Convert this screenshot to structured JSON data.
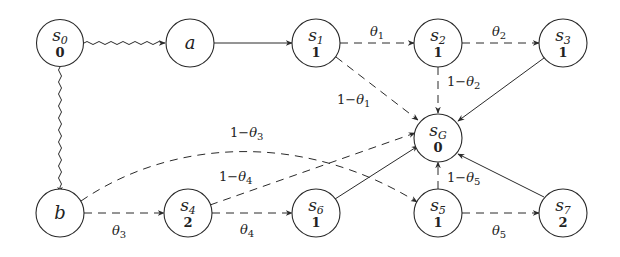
{
  "diagram": {
    "type": "state-graph",
    "nodes": [
      {
        "id": "s0",
        "name": "s",
        "sub": "0",
        "value": "0",
        "x": 60,
        "y": 43
      },
      {
        "id": "a",
        "name": "a",
        "sub": "",
        "value": "",
        "x": 190,
        "y": 43
      },
      {
        "id": "s1",
        "name": "s",
        "sub": "1",
        "value": "1",
        "x": 316,
        "y": 43
      },
      {
        "id": "s2",
        "name": "s",
        "sub": "2",
        "value": "1",
        "x": 438,
        "y": 43
      },
      {
        "id": "s3",
        "name": "s",
        "sub": "3",
        "value": "1",
        "x": 563,
        "y": 43
      },
      {
        "id": "sG",
        "name": "s",
        "sub": "G",
        "value": "0",
        "x": 438,
        "y": 138
      },
      {
        "id": "b",
        "name": "b",
        "sub": "",
        "value": "",
        "x": 60,
        "y": 213
      },
      {
        "id": "s4",
        "name": "s",
        "sub": "4",
        "value": "2",
        "x": 188,
        "y": 213
      },
      {
        "id": "s6",
        "name": "s",
        "sub": "6",
        "value": "1",
        "x": 316,
        "y": 213
      },
      {
        "id": "s5",
        "name": "s",
        "sub": "5",
        "value": "1",
        "x": 438,
        "y": 213
      },
      {
        "id": "s7",
        "name": "s",
        "sub": "7",
        "value": "2",
        "x": 563,
        "y": 213
      }
    ],
    "edges": [
      {
        "from": "s0",
        "to": "a",
        "style": "wavy",
        "label": ""
      },
      {
        "from": "s0",
        "to": "b",
        "style": "wavy",
        "label": ""
      },
      {
        "from": "a",
        "to": "s1",
        "style": "solid",
        "label": ""
      },
      {
        "from": "s1",
        "to": "s2",
        "style": "dashed",
        "label": "θ",
        "label_sub": "1"
      },
      {
        "from": "s2",
        "to": "s3",
        "style": "dashed",
        "label": "θ",
        "label_sub": "2"
      },
      {
        "from": "s1",
        "to": "sG",
        "style": "dashed",
        "label": "1−θ",
        "label_sub": "1"
      },
      {
        "from": "s2",
        "to": "sG",
        "style": "dashed",
        "label": "1−θ",
        "label_sub": "2"
      },
      {
        "from": "s3",
        "to": "sG",
        "style": "solid",
        "label": ""
      },
      {
        "from": "b",
        "to": "s4",
        "style": "dashed",
        "label": "θ",
        "label_sub": "3"
      },
      {
        "from": "b",
        "to": "s5",
        "style": "dashed-curved",
        "label": "1−θ",
        "label_sub": "3"
      },
      {
        "from": "s4",
        "to": "s6",
        "style": "dashed",
        "label": "θ",
        "label_sub": "4"
      },
      {
        "from": "s4",
        "to": "sG",
        "style": "dashed",
        "label": "1−θ",
        "label_sub": "4"
      },
      {
        "from": "s6",
        "to": "sG",
        "style": "solid",
        "label": ""
      },
      {
        "from": "s5",
        "to": "sG",
        "style": "dashed",
        "label": "1−θ",
        "label_sub": "5"
      },
      {
        "from": "s5",
        "to": "s7",
        "style": "dashed",
        "label": "θ",
        "label_sub": "5"
      },
      {
        "from": "s7",
        "to": "sG",
        "style": "solid",
        "label": ""
      }
    ]
  },
  "labels": {
    "s0": {
      "main": "s",
      "sub": "0",
      "val": "0"
    },
    "a": {
      "main": "a"
    },
    "s1": {
      "main": "s",
      "sub": "1",
      "val": "1"
    },
    "s2": {
      "main": "s",
      "sub": "2",
      "val": "1"
    },
    "s3": {
      "main": "s",
      "sub": "3",
      "val": "1"
    },
    "sG": {
      "main": "s",
      "sub": "G",
      "val": "0"
    },
    "b": {
      "main": "b"
    },
    "s4": {
      "main": "s",
      "sub": "4",
      "val": "2"
    },
    "s6": {
      "main": "s",
      "sub": "6",
      "val": "1"
    },
    "s5": {
      "main": "s",
      "sub": "5",
      "val": "1"
    },
    "s7": {
      "main": "s",
      "sub": "7",
      "val": "2"
    },
    "e_s1_s2": {
      "pre": "",
      "theta": "θ",
      "sub": "1"
    },
    "e_s2_s3": {
      "pre": "",
      "theta": "θ",
      "sub": "2"
    },
    "e_s1_sG": {
      "pre": "1−",
      "theta": "θ",
      "sub": "1"
    },
    "e_s2_sG": {
      "pre": "1−",
      "theta": "θ",
      "sub": "2"
    },
    "e_b_s4": {
      "pre": "",
      "theta": "θ",
      "sub": "3"
    },
    "e_b_s5": {
      "pre": "1−",
      "theta": "θ",
      "sub": "3"
    },
    "e_s4_s6": {
      "pre": "",
      "theta": "θ",
      "sub": "4"
    },
    "e_s4_sG": {
      "pre": "1−",
      "theta": "θ",
      "sub": "4"
    },
    "e_s5_sG": {
      "pre": "1−",
      "theta": "θ",
      "sub": "5"
    },
    "e_s5_s7": {
      "pre": "",
      "theta": "θ",
      "sub": "5"
    }
  },
  "colors": {
    "stroke": "#2a2a2a",
    "background": "#ffffff",
    "text": "#222222"
  }
}
